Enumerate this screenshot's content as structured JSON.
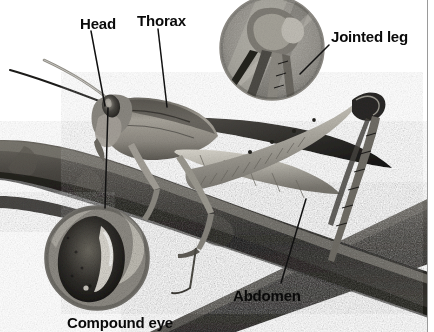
{
  "figure": {
    "background_color": "#ffffff",
    "label_color": "#0a0a0a",
    "leader_color": "#111111",
    "rule_color": "#9a9a9a",
    "width": 434,
    "height": 332
  },
  "labels": {
    "head": "Head",
    "thorax": "Thorax",
    "jointed_leg": "Jointed leg",
    "abdomen": "Abdomen",
    "compound_eye": "Compound eye"
  },
  "callouts": [
    {
      "id": "jointed-leg-inset",
      "label": "Jointed leg",
      "shape": "circle",
      "cx": 272,
      "cy": 48,
      "r": 52,
      "subject": "magnified knee joint of hind leg"
    },
    {
      "id": "compound-eye-inset",
      "label": "Compound eye",
      "shape": "circle",
      "cx": 97,
      "cy": 258,
      "r": 52,
      "subject": "magnified compound eye"
    }
  ],
  "leader_lines": [
    {
      "id": "head-leader",
      "from": [
        91,
        31
      ],
      "to": [
        105,
        106
      ]
    },
    {
      "id": "thorax-leader",
      "from": [
        158,
        29
      ],
      "to": [
        167,
        107
      ]
    },
    {
      "id": "jointed-leg-leader",
      "from": [
        329,
        45
      ],
      "to": [
        300,
        74
      ]
    },
    {
      "id": "abdomen-leader",
      "from": [
        306,
        199
      ],
      "to": [
        281,
        283
      ]
    },
    {
      "id": "compound-eye-leader",
      "from": [
        108,
        108
      ],
      "to": [
        105,
        208
      ]
    }
  ],
  "anatomy_parts": [
    "Head",
    "Thorax",
    "Abdomen",
    "Jointed leg",
    "Compound eye",
    "Antennae",
    "Wing",
    "Hind femur"
  ],
  "palette": {
    "branch_dark": "#2b2a28",
    "branch_mid": "#4a4844",
    "body_light": "#b9b6ae",
    "body_mid": "#8d8a83",
    "body_dark": "#3a3834",
    "inset_ring": "#6f6d68",
    "white": "#ffffff"
  }
}
